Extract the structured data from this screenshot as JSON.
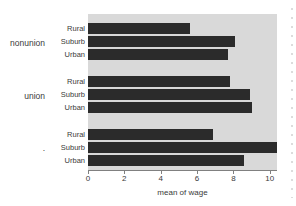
{
  "chart_data": {
    "type": "bar",
    "orientation": "horizontal",
    "title": "",
    "subtitle": "",
    "xlabel": "mean of wage",
    "ylabel": "",
    "xlim": [
      0,
      10.4
    ],
    "xticks": [
      0,
      2,
      4,
      6,
      8,
      10
    ],
    "xtick_labels": [
      "0",
      "2",
      "4",
      "6",
      "8",
      "10"
    ],
    "grid": false,
    "legend": false,
    "legend_position": "none",
    "group_label_field": "union",
    "category_label_field": "smsa",
    "groups": [
      {
        "group_label": "nonunion",
        "categories": [
          "Rural",
          "Suburb",
          "Urban"
        ],
        "values": [
          5.6,
          8.1,
          7.7
        ]
      },
      {
        "group_label": "union",
        "categories": [
          "Rural",
          "Suburb",
          "Urban"
        ],
        "values": [
          7.8,
          8.9,
          9.0
        ]
      },
      {
        "group_label": ".",
        "categories": [
          "Rural",
          "Suburb",
          "Urban"
        ],
        "values": [
          6.9,
          10.4,
          8.6
        ]
      }
    ],
    "colors": {
      "bar": "#2b2b2b",
      "panel_background": "#d9d9d9",
      "figure_background": "#ffffff",
      "axis": "#808080",
      "text": "#3a3a3a"
    }
  }
}
